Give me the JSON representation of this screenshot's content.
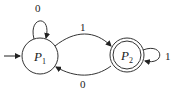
{
  "diagram": {
    "type": "finite-automaton",
    "states": [
      {
        "id": "P1",
        "label_main": "P",
        "label_sub": "1",
        "start": true,
        "accepting": false
      },
      {
        "id": "P2",
        "label_main": "P",
        "label_sub": "2",
        "start": false,
        "accepting": true
      }
    ],
    "transitions": [
      {
        "from": "P1",
        "to": "P1",
        "symbol": "0"
      },
      {
        "from": "P1",
        "to": "P2",
        "symbol": "1"
      },
      {
        "from": "P2",
        "to": "P2",
        "symbol": "1"
      },
      {
        "from": "P2",
        "to": "P1",
        "symbol": "0"
      }
    ]
  }
}
